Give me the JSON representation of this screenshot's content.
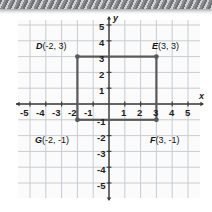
{
  "figure": {
    "name": "coordinate-plane-rectangle-DEFG",
    "background": "#ffffff",
    "plane_background": "#fbfbfb",
    "grid_color": "#c8ccd0",
    "axis_color": "#3b3b3b",
    "shape_color": "#58595b",
    "axis_names": {
      "x": "x",
      "y": "y"
    }
  },
  "axes": {
    "x_ticks": [
      "-5",
      "-4",
      "-3",
      "-2",
      "-1",
      "1",
      "2",
      "3",
      "4",
      "5"
    ],
    "y_ticks": [
      "5",
      "4",
      "3",
      "2",
      "1",
      "-1",
      "-2",
      "-3",
      "-4",
      "-5"
    ],
    "xlim": [
      -5.6,
      5.6
    ],
    "ylim": [
      -5.6,
      5.6
    ],
    "unit_px": 15.8,
    "origin_px": [
      109,
      104
    ]
  },
  "points": [
    {
      "name": "D",
      "coords": "(-2, 3)",
      "x": -2,
      "y": 3,
      "label_x": 36,
      "label_y": 42
    },
    {
      "name": "E",
      "coords": "(3, 3)",
      "x": 3,
      "y": 3,
      "label_x": 152,
      "label_y": 42
    },
    {
      "name": "F",
      "coords": "(3, -1)",
      "x": 3,
      "y": -1,
      "label_x": 150,
      "label_y": 136
    },
    {
      "name": "G",
      "coords": "(-2, -1)",
      "x": -2,
      "y": -1,
      "label_x": 35,
      "label_y": 136
    }
  ],
  "shape": {
    "type": "rectangle",
    "vertices": [
      "D",
      "E",
      "F",
      "G"
    ],
    "x_range": [
      -2,
      3
    ],
    "y_range": [
      -1,
      3
    ],
    "width_units": 5,
    "height_units": 4
  },
  "chart_data": {
    "type": "scatter",
    "title": "",
    "xlabel": "x",
    "ylabel": "y",
    "xlim": [
      -5.6,
      5.6
    ],
    "ylim": [
      -5.6,
      5.6
    ],
    "grid": true,
    "legend": "none",
    "series": [
      {
        "name": "Rectangle DEFG",
        "points": [
          {
            "label": "D",
            "x": -2,
            "y": 3
          },
          {
            "label": "E",
            "x": 3,
            "y": 3
          },
          {
            "label": "F",
            "x": 3,
            "y": -1
          },
          {
            "label": "G",
            "x": -2,
            "y": -1
          }
        ],
        "closed_path": true
      }
    ],
    "annotations": [
      "D(-2, 3)",
      "E(3, 3)",
      "F(3, -1)",
      "G(-2, -1)"
    ]
  }
}
